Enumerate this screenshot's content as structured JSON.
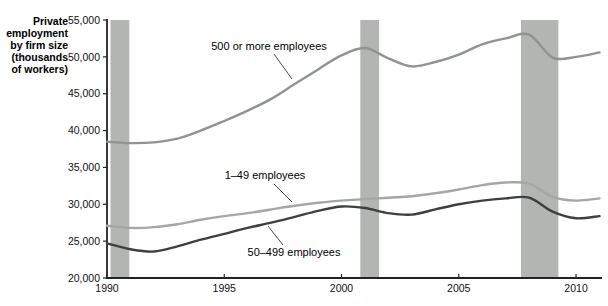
{
  "figure": {
    "y_axis_title_lines": [
      "Private",
      "employment",
      "by firm size",
      "(thousands",
      "of workers)"
    ]
  },
  "chart_data": {
    "type": "line",
    "title": "",
    "xlabel": "",
    "ylabel": "Private employment by firm size (thousands of workers)",
    "grid": false,
    "legend_position": "inline-annotations",
    "x_years": [
      1990,
      1991,
      1992,
      1993,
      1994,
      1995,
      1996,
      1997,
      1998,
      1999,
      2000,
      2001,
      2002,
      2003,
      2004,
      2005,
      2006,
      2007,
      2008,
      2009,
      2010,
      2011
    ],
    "series": [
      {
        "key": "500-or-more",
        "name": "500 or more employees",
        "color": "#8e948e",
        "values": [
          38500,
          38300,
          38400,
          38900,
          40000,
          41300,
          42700,
          44300,
          46300,
          48300,
          50200,
          51200,
          49800,
          48700,
          49300,
          50300,
          51700,
          52500,
          53000,
          49900,
          50000,
          50600
        ]
      },
      {
        "key": "1-49",
        "name": "1–49 employees",
        "color": "#a3a8a2",
        "values": [
          27100,
          26800,
          26900,
          27300,
          27900,
          28400,
          28800,
          29300,
          29800,
          30200,
          30500,
          30700,
          30900,
          31100,
          31500,
          32000,
          32600,
          32950,
          32800,
          31000,
          30500,
          30800
        ]
      },
      {
        "key": "50-499",
        "name": "50–499 employees",
        "color": "#3c403e",
        "values": [
          24700,
          23900,
          23600,
          24300,
          25200,
          26000,
          26800,
          27500,
          28300,
          29100,
          29700,
          29500,
          28800,
          28600,
          29300,
          30000,
          30500,
          30800,
          30900,
          29000,
          28100,
          28400
        ]
      }
    ],
    "y_axis": {
      "min": 20000,
      "max": 55000,
      "tick_step": 5000,
      "tick_labels": [
        "20,000",
        "25,000",
        "30,000",
        "35,000",
        "40,000",
        "45,000",
        "50,000",
        "55,000"
      ]
    },
    "x_axis": {
      "min": 1990,
      "max": 2011,
      "tick_years": [
        1990,
        1995,
        2000,
        2005,
        2010
      ],
      "tick_labels": [
        "1990",
        "1995",
        "2000",
        "2005",
        "2010"
      ]
    },
    "recession_bands": [
      {
        "start": 1990.15,
        "end": 1990.95
      },
      {
        "start": 2000.8,
        "end": 2001.6
      },
      {
        "start": 2007.65,
        "end": 2009.25
      }
    ],
    "band_color": "#b3b5b3",
    "axis_color": "#222222"
  }
}
